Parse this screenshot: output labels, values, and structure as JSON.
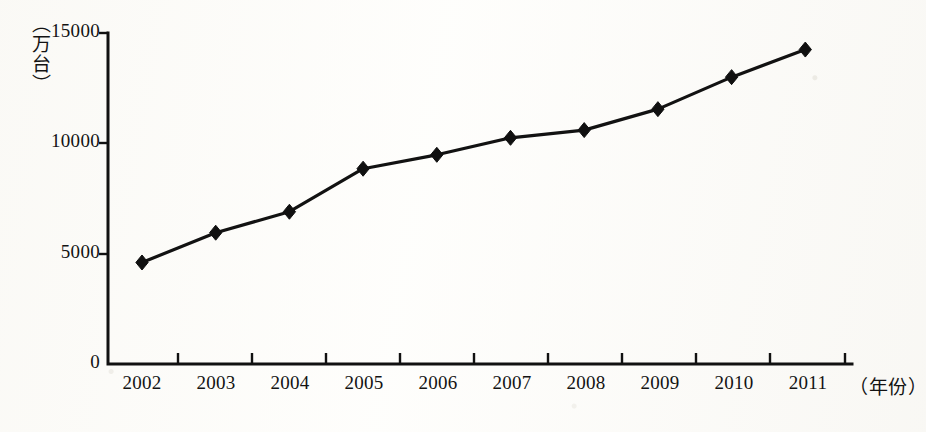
{
  "chart_data": {
    "type": "line",
    "title": "",
    "subtitle": "",
    "xlabel": "（年份）",
    "ylabel": "（万台）",
    "categories": [
      "2002",
      "2003",
      "2004",
      "2005",
      "2006",
      "2007",
      "2008",
      "2009",
      "2010",
      "2011"
    ],
    "values": [
      4600,
      5950,
      6900,
      8850,
      9480,
      10250,
      10600,
      11550,
      13000,
      14250
    ],
    "series": [
      {
        "name": "",
        "values": [
          4600,
          5950,
          6900,
          8850,
          9480,
          10250,
          10600,
          11550,
          13000,
          14250
        ]
      }
    ],
    "ylim": [
      0,
      15000
    ],
    "y_ticks": [
      0,
      5000,
      10000,
      15000
    ],
    "y_tick_labels": [
      "0",
      "5000",
      "10000",
      "15000"
    ],
    "x_tick_labels": [
      "2002",
      "2003",
      "2004",
      "2005",
      "2006",
      "2007",
      "2008",
      "2009",
      "2010",
      "2011"
    ],
    "grid": false,
    "legend": false,
    "legend_position": "none",
    "marker": "diamond",
    "line_color": "#121212",
    "marker_color": "#101010",
    "axis_color": "#111111",
    "background_color": "#fdfcfa",
    "annotations": []
  },
  "axis_titles": {
    "y": "（万台）",
    "x": "（年份）"
  }
}
